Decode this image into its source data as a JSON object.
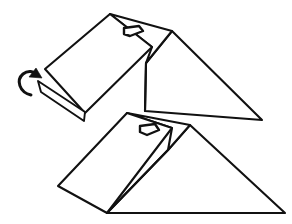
{
  "document": {
    "title": "Folding Step Diagram",
    "kind": "line-drawing",
    "background_color": "#ffffff",
    "ink_color": "#111111",
    "width": 292,
    "height": 224
  },
  "figure": {
    "name": "two-stage-fold-illustration",
    "stroke_color": "#111111",
    "fill_color": "#ffffff",
    "stroke_width": 2.1
  },
  "upper_object": {
    "name": "upper-wedge",
    "label": "",
    "top_face": {
      "name": "upper-top-panel",
      "points": "110,14 45,69 85,113 152,47"
    },
    "ridge_panel": {
      "name": "upper-ridge-panel",
      "points": "110,14 172,31 146,63 152,47"
    },
    "side_triangle": {
      "name": "upper-side-triangle",
      "points": "172,31 262,120 145,111 146,63"
    },
    "inner_edge": {
      "name": "upper-inner-edge",
      "path": "M146,63 L145,111"
    },
    "front_flap": {
      "name": "upper-front-flap",
      "points": "38,81 85,112 84,121 41,92"
    },
    "handle_slot": {
      "name": "upper-handle-slot",
      "points": "124,28 139,26 143,31 130,36 124,34",
      "center_x": 133,
      "center_y": 31
    }
  },
  "lower_object": {
    "name": "lower-wedge",
    "label": "",
    "top_face": {
      "name": "lower-top-panel",
      "points": "127,113 58,186 107,213 172,128"
    },
    "ridge_panel": {
      "name": "lower-ridge-panel",
      "points": "127,113 190,125 168,150 172,128"
    },
    "side_triangle": {
      "name": "lower-side-triangle",
      "points": "190,125 285,213 107,213 168,150"
    },
    "inner_edge": {
      "name": "lower-inner-edge",
      "path": "M168,150 L107,213"
    },
    "handle_slot": {
      "name": "lower-handle-slot",
      "points": "140,126 155,124 159,130 147,135 140,132",
      "center_x": 149,
      "center_y": 129
    }
  },
  "fold_arrow": {
    "name": "fold-direction-arrow",
    "meaning": "rotate-fold-upward",
    "color": "#111111",
    "curve_path": "M31,95 C19,92 16,80 23,74 C28,70 34,71 36,75",
    "head_points": "36,68 42,78 29,77",
    "tip_x": 36,
    "tip_y": 70
  },
  "annotations": {
    "step_label": "",
    "caption": ""
  }
}
